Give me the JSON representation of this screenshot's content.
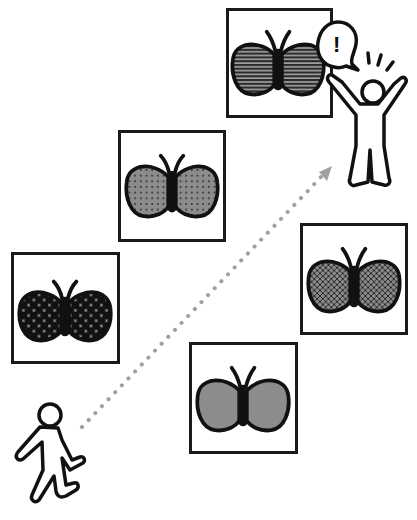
{
  "scene": {
    "title": "Person walking past butterfly specimens, discovering a striped butterfly",
    "canvas": {
      "width": 417,
      "height": 520,
      "background": "#ffffff"
    },
    "colors": {
      "outline": "#1a1a1a",
      "wing_gray": "#8c8c8c",
      "dotted_path": "#a0a0a0",
      "frame_border": "#1a1a1a"
    }
  },
  "frames": [
    {
      "id": "checker",
      "label": "Butterfly with black checker-dot pattern",
      "pattern": "checker-dots",
      "x": 11,
      "y": 252,
      "w": 109,
      "h": 112
    },
    {
      "id": "dotted",
      "label": "Butterfly with gray dotted pattern",
      "pattern": "small-dots",
      "x": 118,
      "y": 130,
      "w": 108,
      "h": 112
    },
    {
      "id": "striped",
      "label": "Butterfly with horizontal stripes",
      "pattern": "stripes",
      "x": 226,
      "y": 8,
      "w": 107,
      "h": 110
    },
    {
      "id": "crosshatch",
      "label": "Butterfly with crosshatch pattern",
      "pattern": "crosshatch",
      "x": 300,
      "y": 223,
      "w": 108,
      "h": 112
    },
    {
      "id": "plain",
      "label": "Butterfly with plain gray wings",
      "pattern": "solid-gray",
      "x": 189,
      "y": 342,
      "w": 109,
      "h": 112
    }
  ],
  "characters": {
    "walker": {
      "label": "Walking person",
      "pose": "walking"
    },
    "excited": {
      "label": "Excited person with raised arms",
      "pose": "arms-raised"
    }
  },
  "speech_bubble": {
    "text": "!",
    "label": "Exclamation speech bubble"
  },
  "path": {
    "label": "Dotted arrow path from walker to excited person",
    "style": "dotted-arrow"
  }
}
